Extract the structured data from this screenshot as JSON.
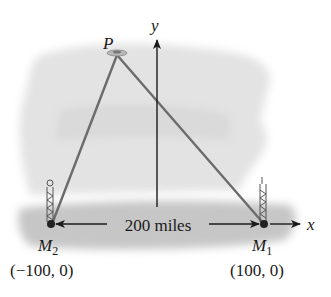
{
  "diagram": {
    "point_p_label": "P",
    "y_axis_label": "y",
    "x_axis_label": "x",
    "distance_label": "200 miles",
    "stations": [
      {
        "name": "M",
        "sub": "1",
        "coords": "(100, 0)"
      },
      {
        "name": "M",
        "sub": "2",
        "coords": "(−100, 0)"
      }
    ],
    "colors": {
      "triangle_lines": "#6b6b6b",
      "axes": "#1a1a1a",
      "background_shading": "#d8d8d8",
      "ground_shading": "#c4c4c4"
    }
  }
}
